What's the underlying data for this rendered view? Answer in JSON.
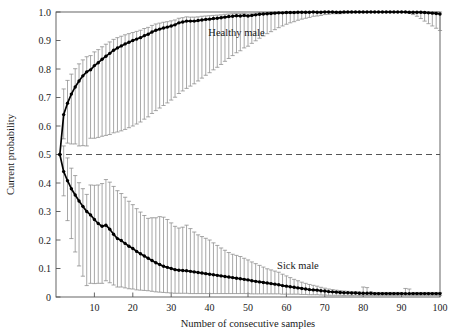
{
  "chart_data": {
    "type": "line",
    "title": "",
    "xlabel": "Number of consecutive samples",
    "ylabel": "Current probability",
    "xlim": [
      0,
      100
    ],
    "ylim": [
      0,
      1.0
    ],
    "xticks": [
      10,
      20,
      30,
      40,
      50,
      60,
      70,
      80,
      90,
      100
    ],
    "xtick_labels": [
      "10",
      "20",
      "30",
      "40",
      "50",
      "60",
      "70",
      "80",
      "90",
      "100"
    ],
    "yticks": [
      0,
      0.1,
      0.2,
      0.3,
      0.4,
      0.5,
      0.6,
      0.7,
      0.8,
      0.9,
      1.0
    ],
    "ytick_labels": [
      "0",
      "0.1",
      "0.2",
      "0.3",
      "0.4",
      "0.5",
      "0.6",
      "0.7",
      "0.8",
      "0.9",
      "1.0"
    ],
    "grid": false,
    "legend_position": "inline-annotation",
    "reference_line": {
      "y": 0.5,
      "style": "dashed",
      "color": "#555555"
    },
    "marker": "filled-circle",
    "line_color": "#000000",
    "errorbar_color": "#8a8a8a",
    "annotations": [
      {
        "text": "Healthy male",
        "x": 47,
        "y": 0.915
      },
      {
        "text": "Sick male",
        "x": 63,
        "y": 0.1
      }
    ],
    "series": [
      {
        "name": "Healthy male",
        "x": [
          1,
          2,
          3,
          4,
          5,
          6,
          7,
          8,
          9,
          10,
          11,
          12,
          13,
          14,
          15,
          16,
          17,
          18,
          19,
          20,
          21,
          22,
          23,
          24,
          25,
          26,
          27,
          28,
          29,
          30,
          31,
          32,
          33,
          34,
          35,
          36,
          37,
          38,
          39,
          40,
          41,
          42,
          43,
          44,
          45,
          46,
          47,
          48,
          49,
          50,
          51,
          52,
          53,
          54,
          55,
          56,
          57,
          58,
          59,
          60,
          61,
          62,
          63,
          64,
          65,
          66,
          67,
          68,
          69,
          70,
          71,
          72,
          73,
          74,
          75,
          76,
          77,
          78,
          79,
          80,
          81,
          82,
          83,
          84,
          85,
          86,
          87,
          88,
          89,
          90,
          91,
          92,
          93,
          94,
          95,
          96,
          97,
          98,
          99,
          100
        ],
        "values": [
          0.5,
          0.64,
          0.68,
          0.712,
          0.737,
          0.758,
          0.776,
          0.79,
          0.797,
          0.812,
          0.822,
          0.834,
          0.845,
          0.855,
          0.866,
          0.874,
          0.881,
          0.888,
          0.894,
          0.9,
          0.905,
          0.91,
          0.917,
          0.922,
          0.93,
          0.936,
          0.94,
          0.944,
          0.947,
          0.951,
          0.955,
          0.962,
          0.965,
          0.968,
          0.968,
          0.968,
          0.97,
          0.972,
          0.974,
          0.975,
          0.977,
          0.978,
          0.98,
          0.982,
          0.984,
          0.985,
          0.987,
          0.986,
          0.988,
          0.986,
          0.988,
          0.99,
          0.992,
          0.993,
          0.994,
          0.995,
          0.996,
          0.997,
          0.997,
          0.998,
          0.998,
          0.998,
          0.999,
          0.999,
          0.999,
          0.999,
          1.0,
          0.999,
          0.999,
          1.0,
          1.0,
          1.0,
          0.999,
          0.999,
          1.0,
          1.0,
          1.0,
          1.0,
          1.0,
          1.0,
          1.0,
          1.0,
          1.0,
          1.0,
          1.0,
          1.0,
          1.0,
          1.0,
          1.0,
          1.0,
          1.0,
          0.999,
          0.999,
          0.999,
          0.999,
          0.998,
          0.997,
          0.996,
          0.995,
          0.993
        ],
        "err_low": [
          0.0,
          0.085,
          0.14,
          0.175,
          0.2,
          0.228,
          0.245,
          0.26,
          0.24,
          0.255,
          0.262,
          0.27,
          0.278,
          0.285,
          0.29,
          0.295,
          0.298,
          0.3,
          0.3,
          0.3,
          0.298,
          0.296,
          0.293,
          0.29,
          0.286,
          0.282,
          0.277,
          0.272,
          0.266,
          0.26,
          0.254,
          0.248,
          0.242,
          0.236,
          0.228,
          0.22,
          0.212,
          0.204,
          0.196,
          0.188,
          0.18,
          0.172,
          0.164,
          0.155,
          0.147,
          0.138,
          0.13,
          0.122,
          0.114,
          0.106,
          0.098,
          0.091,
          0.084,
          0.077,
          0.07,
          0.064,
          0.058,
          0.052,
          0.046,
          0.041,
          0.036,
          0.032,
          0.028,
          0.024,
          0.021,
          0.018,
          0.015,
          0.013,
          0.011,
          0.009,
          0.008,
          0.006,
          0.005,
          0.005,
          0.004,
          0.003,
          0.003,
          0.002,
          0.002,
          0.002,
          0.001,
          0.001,
          0.001,
          0.001,
          0.001,
          0.001,
          0.001,
          0.001,
          0.001,
          0.001,
          0.002,
          0.004,
          0.008,
          0.014,
          0.022,
          0.03,
          0.038,
          0.045,
          0.052,
          0.058
        ],
        "err_high": [
          0.0,
          0.09,
          0.08,
          0.07,
          0.064,
          0.06,
          0.056,
          0.053,
          0.05,
          0.048,
          0.046,
          0.044,
          0.042,
          0.04,
          0.038,
          0.036,
          0.034,
          0.032,
          0.03,
          0.028,
          0.027,
          0.026,
          0.025,
          0.024,
          0.023,
          0.022,
          0.021,
          0.02,
          0.019,
          0.018,
          0.017,
          0.016,
          0.015,
          0.015,
          0.014,
          0.014,
          0.013,
          0.013,
          0.012,
          0.012,
          0.011,
          0.011,
          0.01,
          0.01,
          0.009,
          0.009,
          0.008,
          0.008,
          0.007,
          0.007,
          0.006,
          0.006,
          0.005,
          0.005,
          0.004,
          0.004,
          0.003,
          0.003,
          0.003,
          0.002,
          0.002,
          0.002,
          0.001,
          0.001,
          0.001,
          0.001,
          0.0,
          0.001,
          0.001,
          0.0,
          0.0,
          0.0,
          0.001,
          0.001,
          0.0,
          0.0,
          0.0,
          0.0,
          0.0,
          0.0,
          0.0,
          0.0,
          0.0,
          0.0,
          0.0,
          0.0,
          0.0,
          0.0,
          0.0,
          0.0,
          0.0,
          0.001,
          0.001,
          0.001,
          0.001,
          0.002,
          0.003,
          0.004,
          0.005,
          0.007
        ]
      },
      {
        "name": "Sick male",
        "x": [
          1,
          2,
          3,
          4,
          5,
          6,
          7,
          8,
          9,
          10,
          11,
          12,
          13,
          14,
          15,
          16,
          17,
          18,
          19,
          20,
          21,
          22,
          23,
          24,
          25,
          26,
          27,
          28,
          29,
          30,
          31,
          32,
          33,
          34,
          35,
          36,
          37,
          38,
          39,
          40,
          41,
          42,
          43,
          44,
          45,
          46,
          47,
          48,
          49,
          50,
          51,
          52,
          53,
          54,
          55,
          56,
          57,
          58,
          59,
          60,
          61,
          62,
          63,
          64,
          65,
          66,
          67,
          68,
          69,
          70,
          71,
          72,
          73,
          74,
          75,
          76,
          77,
          78,
          79,
          80,
          81,
          82,
          83,
          84,
          85,
          86,
          87,
          88,
          89,
          90,
          91,
          92,
          93,
          94,
          95,
          96,
          97,
          98,
          99,
          100
        ],
        "values": [
          0.5,
          0.44,
          0.408,
          0.38,
          0.358,
          0.337,
          0.318,
          0.3,
          0.288,
          0.272,
          0.258,
          0.248,
          0.252,
          0.238,
          0.22,
          0.205,
          0.198,
          0.188,
          0.178,
          0.17,
          0.16,
          0.152,
          0.144,
          0.136,
          0.128,
          0.12,
          0.114,
          0.108,
          0.104,
          0.1,
          0.096,
          0.094,
          0.093,
          0.092,
          0.09,
          0.088,
          0.086,
          0.084,
          0.082,
          0.08,
          0.078,
          0.076,
          0.074,
          0.072,
          0.07,
          0.068,
          0.066,
          0.064,
          0.062,
          0.06,
          0.057,
          0.055,
          0.053,
          0.051,
          0.049,
          0.047,
          0.045,
          0.043,
          0.04,
          0.038,
          0.036,
          0.034,
          0.032,
          0.03,
          0.028,
          0.026,
          0.025,
          0.024,
          0.022,
          0.021,
          0.019,
          0.018,
          0.017,
          0.016,
          0.015,
          0.015,
          0.014,
          0.014,
          0.013,
          0.013,
          0.013,
          0.013,
          0.012,
          0.012,
          0.012,
          0.012,
          0.012,
          0.012,
          0.012,
          0.012,
          0.012,
          0.012,
          0.012,
          0.012,
          0.012,
          0.012,
          0.012,
          0.012,
          0.012,
          0.012
        ],
        "err_low": [
          0.0,
          0.085,
          0.14,
          0.175,
          0.2,
          0.228,
          0.245,
          0.26,
          0.24,
          0.225,
          0.21,
          0.2,
          0.195,
          0.188,
          0.178,
          0.17,
          0.163,
          0.156,
          0.149,
          0.142,
          0.135,
          0.128,
          0.121,
          0.114,
          0.108,
          0.102,
          0.097,
          0.092,
          0.089,
          0.086,
          0.083,
          0.081,
          0.08,
          0.079,
          0.078,
          0.076,
          0.074,
          0.072,
          0.07,
          0.068,
          0.066,
          0.064,
          0.062,
          0.06,
          0.058,
          0.056,
          0.054,
          0.052,
          0.05,
          0.048,
          0.046,
          0.044,
          0.042,
          0.04,
          0.038,
          0.036,
          0.034,
          0.032,
          0.03,
          0.028,
          0.026,
          0.024,
          0.022,
          0.021,
          0.019,
          0.018,
          0.017,
          0.016,
          0.015,
          0.014,
          0.013,
          0.012,
          0.011,
          0.01,
          0.01,
          0.009,
          0.009,
          0.008,
          0.008,
          0.008,
          0.008,
          0.008,
          0.007,
          0.007,
          0.007,
          0.007,
          0.007,
          0.007,
          0.007,
          0.007,
          0.007,
          0.007,
          0.007,
          0.007,
          0.007,
          0.007,
          0.007,
          0.007,
          0.007,
          0.007
        ],
        "err_high": [
          0.0,
          0.09,
          0.08,
          0.072,
          0.068,
          0.064,
          0.062,
          0.06,
          0.105,
          0.12,
          0.135,
          0.15,
          0.16,
          0.165,
          0.168,
          0.168,
          0.165,
          0.162,
          0.158,
          0.154,
          0.15,
          0.146,
          0.142,
          0.14,
          0.15,
          0.158,
          0.168,
          0.172,
          0.168,
          0.16,
          0.152,
          0.148,
          0.152,
          0.16,
          0.15,
          0.14,
          0.132,
          0.128,
          0.124,
          0.12,
          0.112,
          0.105,
          0.098,
          0.092,
          0.086,
          0.082,
          0.08,
          0.078,
          0.074,
          0.07,
          0.066,
          0.062,
          0.058,
          0.054,
          0.05,
          0.048,
          0.046,
          0.044,
          0.04,
          0.036,
          0.032,
          0.028,
          0.025,
          0.022,
          0.02,
          0.018,
          0.016,
          0.014,
          0.012,
          0.01,
          0.009,
          0.008,
          0.007,
          0.006,
          0.006,
          0.005,
          0.005,
          0.005,
          0.005,
          0.022,
          0.02,
          0.005,
          0.004,
          0.004,
          0.004,
          0.004,
          0.004,
          0.004,
          0.004,
          0.004,
          0.018,
          0.016,
          0.004,
          0.004,
          0.004,
          0.004,
          0.004,
          0.004,
          0.004,
          0.004
        ]
      }
    ]
  }
}
